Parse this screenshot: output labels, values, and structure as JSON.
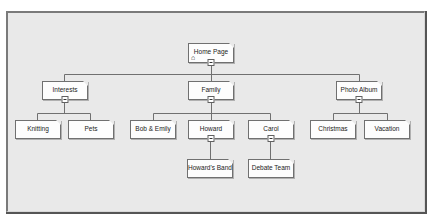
{
  "diagram": {
    "root": {
      "label": "Home Page",
      "icon": "home-icon",
      "children": [
        {
          "label": "Interests",
          "children": [
            {
              "label": "Knitting"
            },
            {
              "label": "Pets"
            }
          ]
        },
        {
          "label": "Family",
          "children": [
            {
              "label": "Bob & Emily"
            },
            {
              "label": "Howard",
              "children": [
                {
                  "label": "Howard's Band"
                }
              ]
            },
            {
              "label": "Carol",
              "children": [
                {
                  "label": "Debate Team"
                }
              ]
            }
          ]
        },
        {
          "label": "Photo Album",
          "children": [
            {
              "label": "Christmas"
            },
            {
              "label": "Vacation"
            }
          ]
        }
      ]
    }
  },
  "nodes": {
    "home": "Home Page",
    "interests": "Interests",
    "knitting": "Knitting",
    "pets": "Pets",
    "family": "Family",
    "bob_emily": "Bob & Emily",
    "howard": "Howard",
    "howards_band": "Howard's Band",
    "carol": "Carol",
    "debate_team": "Debate Team",
    "photo_album": "Photo Album",
    "christmas": "Christmas",
    "vacation": "Vacation"
  },
  "icons": {
    "home": "⌂"
  },
  "colors": {
    "canvas": "#e9e9e9",
    "node_fill": "#fdfdfd",
    "node_border": "#707070",
    "connector": "#707070"
  }
}
